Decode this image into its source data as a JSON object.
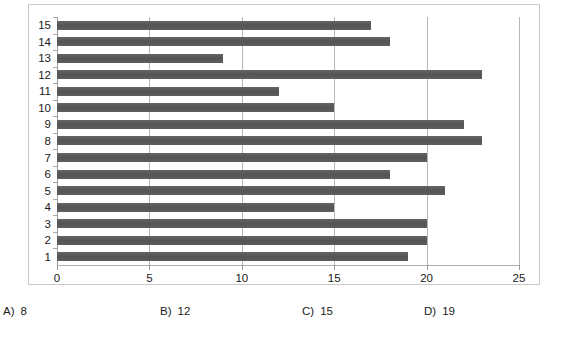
{
  "question": {
    "options": [
      {
        "label": "A)",
        "value": "8"
      },
      {
        "label": "B)",
        "value": "12"
      },
      {
        "label": "C)",
        "value": "15"
      },
      {
        "label": "D)",
        "value": "19"
      }
    ]
  },
  "chart_data": {
    "type": "bar",
    "orientation": "horizontal",
    "title": "",
    "xlabel": "",
    "ylabel": "",
    "categories": [
      "1",
      "2",
      "3",
      "4",
      "5",
      "6",
      "7",
      "8",
      "9",
      "10",
      "11",
      "12",
      "13",
      "14",
      "15"
    ],
    "values": [
      19,
      20,
      20,
      15,
      21,
      18,
      20,
      23,
      22,
      15,
      12,
      23,
      9,
      18,
      17
    ],
    "xlim": [
      0,
      25
    ],
    "xticks": [
      "0",
      "5",
      "10",
      "15",
      "20",
      "25"
    ],
    "xtick_values": [
      0,
      5,
      10,
      15,
      20,
      25
    ],
    "grid": "vertical",
    "legend": "none",
    "bar_color": "#595959",
    "gridline_color": "#b7b7b7",
    "frame_color": "#c9c9c9"
  }
}
